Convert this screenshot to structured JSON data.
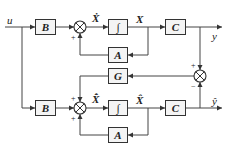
{
  "diagram": {
    "type": "state-observer block diagram",
    "signals": {
      "input": "u",
      "output": "y",
      "estimated_output": "ŷ",
      "state": "X",
      "state_derivative": "Ẋ",
      "estimated_state": "X̂",
      "estimated_state_derivative": "X̂̇"
    },
    "blocks": {
      "plant_B": "B",
      "plant_integrator": "∫",
      "plant_C": "C",
      "plant_A": "A",
      "observer_gain": "G",
      "observer_B": "B",
      "observer_integrator": "∫",
      "observer_C": "C",
      "observer_A": "A"
    },
    "summing_signs": {
      "plant_feedback": "+",
      "error_plus": "+",
      "error_minus": "−",
      "observer_gain_in": "+",
      "observer_feedback": "+"
    }
  }
}
